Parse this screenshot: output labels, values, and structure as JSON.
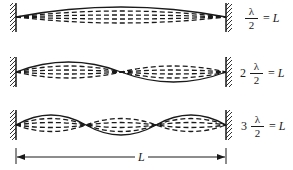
{
  "figure": {
    "modes": [
      {
        "harmonic": 1,
        "coefficient": "",
        "numerator": "λ",
        "denominator": "2",
        "equals": "=",
        "rhs": "L",
        "loops": 1
      },
      {
        "harmonic": 2,
        "coefficient": "2",
        "numerator": "λ",
        "denominator": "2",
        "equals": "=",
        "rhs": "L",
        "loops": 2
      },
      {
        "harmonic": 3,
        "coefficient": "3",
        "numerator": "λ",
        "denominator": "2",
        "equals": "=",
        "rhs": "L",
        "loops": 3
      }
    ],
    "length_label": "L"
  }
}
